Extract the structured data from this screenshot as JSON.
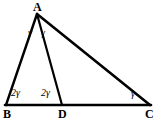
{
  "figure": {
    "type": "geometry-diagram",
    "stroke_color": "#000000",
    "background_color": "#ffffff",
    "canvas": {
      "width": 158,
      "height": 124
    },
    "points": {
      "A": {
        "label": "A",
        "x": 37,
        "y": 14
      },
      "B": {
        "label": "B",
        "x": 6,
        "y": 105
      },
      "C": {
        "label": "C",
        "x": 150,
        "y": 105
      },
      "D": {
        "label": "D",
        "x": 62,
        "y": 105
      }
    },
    "segments": [
      {
        "name": "AB",
        "from": "A",
        "to": "B"
      },
      {
        "name": "AC",
        "from": "A",
        "to": "C"
      },
      {
        "name": "AD",
        "from": "A",
        "to": "D"
      },
      {
        "name": "BC",
        "from": "B",
        "to": "C"
      }
    ],
    "vertex_labels": [
      {
        "name": "A",
        "text": "A",
        "x": 33,
        "y": 1
      },
      {
        "name": "B",
        "text": "B",
        "x": 3,
        "y": 108
      },
      {
        "name": "C",
        "text": "C",
        "x": 145,
        "y": 108
      },
      {
        "name": "D",
        "text": "D",
        "x": 58,
        "y": 108
      }
    ],
    "angle_labels": [
      {
        "name": "angle-bad",
        "coefficient": "",
        "symbol": "γ",
        "text": "γ",
        "x": 28,
        "y": 28
      },
      {
        "name": "angle-dac",
        "coefficient": "",
        "symbol": "γ",
        "text": "γ",
        "x": 41,
        "y": 28
      },
      {
        "name": "angle-abd",
        "coefficient": "2",
        "symbol": "γ",
        "text": "2γ",
        "x": 11,
        "y": 88
      },
      {
        "name": "angle-adb",
        "coefficient": "2",
        "symbol": "γ",
        "text": "2γ",
        "x": 41,
        "y": 88
      },
      {
        "name": "angle-acd",
        "coefficient": "",
        "symbol": "γ",
        "text": "γ",
        "x": 131,
        "y": 89
      }
    ]
  }
}
